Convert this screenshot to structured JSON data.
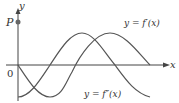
{
  "diagram": {
    "axes": {
      "x_label": "x",
      "y_label": "y",
      "origin_label": "0",
      "point_label": "P"
    },
    "curves": [
      {
        "name": "f-prime",
        "label": "y = f′(x)",
        "color": "#555555"
      },
      {
        "name": "f-double-prime",
        "label": "y = f″(x)",
        "color": "#555555"
      }
    ],
    "colors": {
      "axis": "#444444",
      "curve": "#555555",
      "point": "#666666",
      "text": "#333333"
    }
  }
}
